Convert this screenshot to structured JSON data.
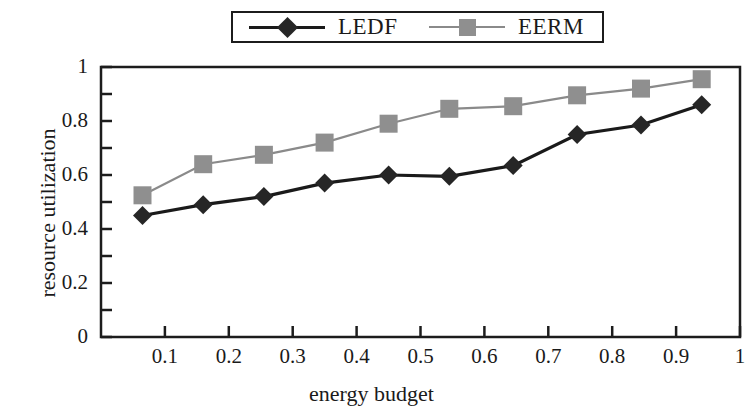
{
  "chart_data": {
    "type": "line",
    "title": "",
    "xlabel": "energy budget",
    "ylabel": "resource utilization",
    "xlim": [
      0,
      1
    ],
    "ylim": [
      0,
      1
    ],
    "grid": false,
    "legend_position": "top-center",
    "x_tick_labels": [
      "0.1",
      "0.2",
      "0.3",
      "0.4",
      "0.5",
      "0.6",
      "0.7",
      "0.8",
      "0.9",
      "1"
    ],
    "x_ticks": [
      0.1,
      0.2,
      0.3,
      0.4,
      0.5,
      0.6,
      0.7,
      0.8,
      0.9,
      1.0
    ],
    "y_tick_labels": [
      "0",
      "0.2",
      "0.4",
      "0.6",
      "0.8",
      "1"
    ],
    "y_ticks": [
      0,
      0.2,
      0.4,
      0.6,
      0.8,
      1.0
    ],
    "y_minor_ticks": [
      0.1,
      0.3,
      0.5,
      0.7,
      0.9
    ],
    "x": [
      0.065,
      0.16,
      0.255,
      0.35,
      0.45,
      0.545,
      0.645,
      0.745,
      0.845,
      0.94
    ],
    "series": [
      {
        "name": "LEDF",
        "marker": "diamond",
        "color": "#262626",
        "line_color": "#1a1a1a",
        "values": [
          0.45,
          0.49,
          0.52,
          0.57,
          0.6,
          0.595,
          0.635,
          0.75,
          0.785,
          0.86
        ]
      },
      {
        "name": "EERM",
        "marker": "square",
        "color": "#8f8f8f",
        "line_color": "#8a8a8a",
        "values": [
          0.525,
          0.64,
          0.675,
          0.72,
          0.79,
          0.845,
          0.855,
          0.895,
          0.92,
          0.955
        ]
      }
    ]
  },
  "legend": {
    "entries": [
      {
        "label": "LEDF"
      },
      {
        "label": "EERM"
      }
    ]
  }
}
